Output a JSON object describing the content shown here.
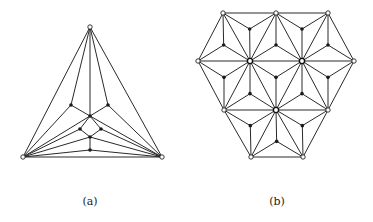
{
  "figure": {
    "panels": [
      {
        "label": "(a)",
        "label_pos": [
          90,
          203
        ],
        "nodes": {
          "T": {
            "xy": [
              90,
              27
            ],
            "style": "open"
          },
          "L": {
            "xy": [
              23,
              157
            ],
            "style": "open"
          },
          "R": {
            "xy": [
              162,
              157
            ],
            "style": "open"
          },
          "P": {
            "xy": [
              71,
              105
            ],
            "style": "filled"
          },
          "Q": {
            "xy": [
              108,
              105
            ],
            "style": "filled"
          },
          "O": {
            "xy": [
              90,
              116
            ],
            "style": "filled"
          },
          "M1": {
            "xy": [
              80,
              129
            ],
            "style": "filled"
          },
          "M2": {
            "xy": [
              101,
              129
            ],
            "style": "filled"
          },
          "N": {
            "xy": [
              90,
              137
            ],
            "style": "filled"
          },
          "S": {
            "xy": [
              90,
              150
            ],
            "style": "filled"
          }
        },
        "edges": [
          [
            "T",
            "L"
          ],
          [
            "T",
            "R"
          ],
          [
            "L",
            "R"
          ],
          [
            "T",
            "P"
          ],
          [
            "T",
            "Q"
          ],
          [
            "T",
            "O"
          ],
          [
            "P",
            "L"
          ],
          [
            "Q",
            "R"
          ],
          [
            "P",
            "O"
          ],
          [
            "Q",
            "O"
          ],
          [
            "O",
            "M1"
          ],
          [
            "O",
            "M2"
          ],
          [
            "M1",
            "N"
          ],
          [
            "M2",
            "N"
          ],
          [
            "N",
            "S"
          ],
          [
            "L",
            "O"
          ],
          [
            "R",
            "O"
          ],
          [
            "L",
            "M1"
          ],
          [
            "R",
            "M2"
          ],
          [
            "L",
            "N"
          ],
          [
            "R",
            "N"
          ],
          [
            "L",
            "S"
          ],
          [
            "R",
            "S"
          ]
        ]
      },
      {
        "label": "(b)",
        "label_pos": [
          277,
          203
        ],
        "nodes": {
          "A1": {
            "xy": [
              223,
              13
            ],
            "style": "open"
          },
          "A2": {
            "xy": [
              276,
              13
            ],
            "style": "open"
          },
          "A3": {
            "xy": [
              328,
              13
            ],
            "style": "open"
          },
          "B1": {
            "xy": [
              198,
              61
            ],
            "style": "open"
          },
          "B2": {
            "xy": [
              250,
              61
            ],
            "style": "big"
          },
          "B3": {
            "xy": [
              302,
              61
            ],
            "style": "big"
          },
          "B4": {
            "xy": [
              354,
              61
            ],
            "style": "open"
          },
          "C1": {
            "xy": [
              224,
              110
            ],
            "style": "open"
          },
          "C2": {
            "xy": [
              276,
              110
            ],
            "style": "big"
          },
          "C3": {
            "xy": [
              328,
              110
            ],
            "style": "open"
          },
          "D1": {
            "xy": [
              251,
              157
            ],
            "style": "open"
          },
          "D2": {
            "xy": [
              303,
              157
            ],
            "style": "open"
          }
        },
        "triangles": [
          [
            "A1",
            "A2",
            "B2"
          ],
          [
            "A2",
            "A3",
            "B3"
          ],
          [
            "B1",
            "A1",
            "B2"
          ],
          [
            "B2",
            "A2",
            "B3"
          ],
          [
            "B3",
            "A3",
            "B4"
          ],
          [
            "B1",
            "B2",
            "C1"
          ],
          [
            "B2",
            "B3",
            "C2"
          ],
          [
            "B3",
            "B4",
            "C3"
          ],
          [
            "C1",
            "B2",
            "C2"
          ],
          [
            "C2",
            "B3",
            "C3"
          ],
          [
            "C1",
            "C2",
            "D1"
          ],
          [
            "C2",
            "C3",
            "D2"
          ],
          [
            "D1",
            "C2",
            "D2"
          ]
        ]
      }
    ]
  }
}
